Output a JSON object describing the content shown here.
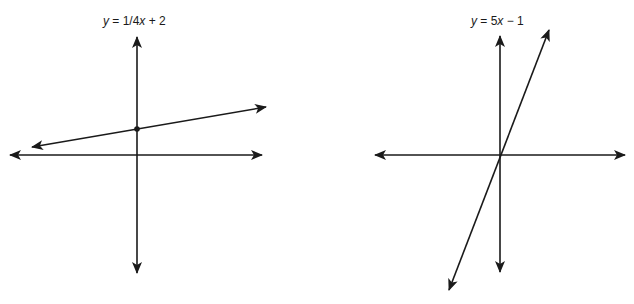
{
  "colors": {
    "line": "#1a1a1a",
    "background": "#ffffff"
  },
  "graphs": [
    {
      "title_var": "y",
      "title_rest": " = 1/4",
      "title_var2": "x",
      "title_tail": " + 2",
      "equation": "y = 1/4x + 2",
      "slope": "1/4",
      "intercept": "2",
      "has_intercept_dot": true
    },
    {
      "title_var": "y",
      "title_rest": " = 5",
      "title_var2": "x",
      "title_tail": " − 1",
      "equation": "y = 5x − 1",
      "slope": "5",
      "intercept": "-1",
      "has_intercept_dot": false
    }
  ]
}
